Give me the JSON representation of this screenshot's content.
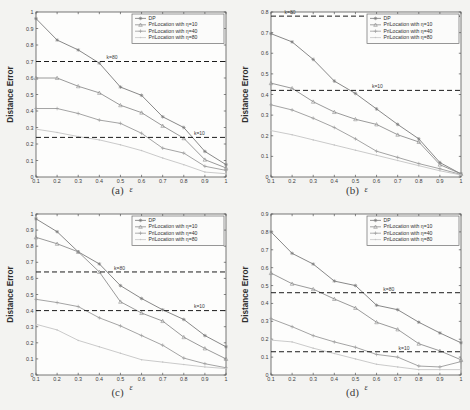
{
  "figure": {
    "background": "#f3f3f1",
    "axis_color": "#555555",
    "dash_color": "#1c1c1c"
  },
  "legend": {
    "entries": [
      {
        "label": "DP",
        "marker": "asterisk",
        "color": "#7a7a7a"
      },
      {
        "label": "PriLocation with η=10",
        "marker": "triangle",
        "color": "#8e8e8e"
      },
      {
        "label": "PriLocation with η=40",
        "marker": "plus",
        "color": "#9a9a9a"
      },
      {
        "label": "PriLocation with η=80",
        "marker": "dot",
        "color": "#c4c4c4"
      }
    ]
  },
  "captions": {
    "a": "(a)",
    "b": "(b)",
    "c": "(c)",
    "d": "(d)"
  },
  "chart_data": [
    {
      "type": "line",
      "panel": "a",
      "title": "",
      "xlabel": "ε",
      "ylabel": "Distance Error",
      "x": [
        0.1,
        0.2,
        0.3,
        0.4,
        0.5,
        0.6,
        0.7,
        0.8,
        0.9,
        1.0
      ],
      "xlim": [
        0.1,
        1.0
      ],
      "ylim": [
        0,
        1.0
      ],
      "xticks": [
        0.1,
        0.2,
        0.3,
        0.4,
        0.5,
        0.6,
        0.7,
        0.8,
        0.9,
        1
      ],
      "yticks": [
        0,
        0.1,
        0.2,
        0.3,
        0.4,
        0.5,
        0.6,
        0.7,
        0.8,
        0.9,
        1
      ],
      "grid": false,
      "legend_position": "top-right",
      "series": [
        {
          "name": "DP",
          "values": [
            0.96,
            0.83,
            0.77,
            0.69,
            0.545,
            0.495,
            0.365,
            0.3,
            0.155,
            0.075
          ]
        },
        {
          "name": "PriLocation with η=10",
          "values": [
            0.6,
            0.6,
            0.55,
            0.51,
            0.435,
            0.39,
            0.31,
            0.235,
            0.105,
            0.055
          ]
        },
        {
          "name": "PriLocation with η=40",
          "values": [
            0.415,
            0.415,
            0.385,
            0.345,
            0.325,
            0.265,
            0.175,
            0.145,
            0.065,
            0.04
          ]
        },
        {
          "name": "PriLocation with η=80",
          "values": [
            0.29,
            0.27,
            0.245,
            0.225,
            0.195,
            0.16,
            0.115,
            0.075,
            0.03,
            0.02
          ]
        }
      ],
      "reference_lines": [
        {
          "label": "k=80",
          "y": 0.7
        },
        {
          "label": "k=10",
          "y": 0.24
        }
      ]
    },
    {
      "type": "line",
      "panel": "b",
      "title": "",
      "xlabel": "ε",
      "ylabel": "Distance Error",
      "x": [
        0.1,
        0.2,
        0.3,
        0.4,
        0.5,
        0.6,
        0.7,
        0.8,
        0.9,
        1.0
      ],
      "xlim": [
        0.1,
        1.0
      ],
      "ylim": [
        0,
        0.8
      ],
      "xticks": [
        0.1,
        0.2,
        0.3,
        0.4,
        0.5,
        0.6,
        0.7,
        0.8,
        0.9,
        1
      ],
      "yticks": [
        0,
        0.1,
        0.2,
        0.3,
        0.4,
        0.5,
        0.6,
        0.7,
        0.8
      ],
      "grid": false,
      "legend_position": "top-right",
      "series": [
        {
          "name": "DP",
          "values": [
            0.695,
            0.655,
            0.57,
            0.465,
            0.405,
            0.33,
            0.255,
            0.185,
            0.07,
            0.015
          ]
        },
        {
          "name": "PriLocation with η=10",
          "values": [
            0.455,
            0.43,
            0.365,
            0.315,
            0.28,
            0.255,
            0.205,
            0.17,
            0.06,
            0.015
          ]
        },
        {
          "name": "PriLocation with η=40",
          "values": [
            0.35,
            0.325,
            0.285,
            0.24,
            0.185,
            0.125,
            0.095,
            0.065,
            0.04,
            0.012
          ]
        },
        {
          "name": "PriLocation with η=80",
          "values": [
            0.225,
            0.205,
            0.18,
            0.155,
            0.13,
            0.105,
            0.08,
            0.055,
            0.03,
            0.01
          ]
        }
      ],
      "reference_lines": [
        {
          "label": "k=80",
          "y": 0.78
        },
        {
          "label": "k=10",
          "y": 0.42
        }
      ]
    },
    {
      "type": "line",
      "panel": "c",
      "title": "",
      "xlabel": "ε",
      "ylabel": "Distance Error",
      "x": [
        0.1,
        0.2,
        0.3,
        0.4,
        0.5,
        0.6,
        0.7,
        0.8,
        0.9,
        1.0
      ],
      "xlim": [
        0.1,
        1.0
      ],
      "ylim": [
        0,
        1.0
      ],
      "xticks": [
        0.1,
        0.2,
        0.3,
        0.4,
        0.5,
        0.6,
        0.7,
        0.8,
        0.9,
        1
      ],
      "yticks": [
        0,
        0.1,
        0.2,
        0.3,
        0.4,
        0.5,
        0.6,
        0.7,
        0.8,
        0.9,
        1
      ],
      "grid": false,
      "legend_position": "top-right",
      "series": [
        {
          "name": "DP",
          "values": [
            0.97,
            0.89,
            0.765,
            0.69,
            0.555,
            0.475,
            0.405,
            0.345,
            0.245,
            0.175
          ]
        },
        {
          "name": "PriLocation with η=10",
          "values": [
            0.855,
            0.815,
            0.765,
            0.64,
            0.455,
            0.385,
            0.335,
            0.235,
            0.165,
            0.1
          ]
        },
        {
          "name": "PriLocation with η=40",
          "values": [
            0.47,
            0.45,
            0.425,
            0.355,
            0.305,
            0.245,
            0.185,
            0.105,
            0.07,
            0.045
          ]
        },
        {
          "name": "PriLocation with η=80",
          "values": [
            0.315,
            0.28,
            0.215,
            0.175,
            0.135,
            0.095,
            0.08,
            0.065,
            0.05,
            0.04
          ]
        }
      ],
      "reference_lines": [
        {
          "label": "k=80",
          "y": 0.64
        },
        {
          "label": "k=10",
          "y": 0.4
        }
      ]
    },
    {
      "type": "line",
      "panel": "d",
      "title": "",
      "xlabel": "ε",
      "ylabel": "Distance Error",
      "x": [
        0.1,
        0.2,
        0.3,
        0.4,
        0.5,
        0.6,
        0.7,
        0.8,
        0.9,
        1.0
      ],
      "xlim": [
        0.1,
        1.0
      ],
      "ylim": [
        0,
        0.9
      ],
      "xticks": [
        0.1,
        0.2,
        0.3,
        0.4,
        0.5,
        0.6,
        0.7,
        0.8,
        0.9,
        1
      ],
      "yticks": [
        0,
        0.1,
        0.2,
        0.3,
        0.4,
        0.5,
        0.6,
        0.7,
        0.8,
        0.9
      ],
      "grid": false,
      "legend_position": "top-right",
      "series": [
        {
          "name": "DP",
          "values": [
            0.8,
            0.68,
            0.62,
            0.525,
            0.5,
            0.39,
            0.365,
            0.295,
            0.235,
            0.18
          ]
        },
        {
          "name": "PriLocation with η=10",
          "values": [
            0.57,
            0.51,
            0.48,
            0.425,
            0.375,
            0.295,
            0.255,
            0.175,
            0.135,
            0.085
          ]
        },
        {
          "name": "PriLocation with η=40",
          "values": [
            0.315,
            0.27,
            0.22,
            0.185,
            0.155,
            0.115,
            0.1,
            0.05,
            0.045,
            0.075
          ]
        },
        {
          "name": "PriLocation with η=80",
          "values": [
            0.195,
            0.185,
            0.15,
            0.12,
            0.09,
            0.06,
            0.045,
            0.03,
            0.03,
            0.03
          ]
        }
      ],
      "reference_lines": [
        {
          "label": "k=80",
          "y": 0.46
        },
        {
          "label": "k=10",
          "y": 0.13
        }
      ]
    }
  ]
}
